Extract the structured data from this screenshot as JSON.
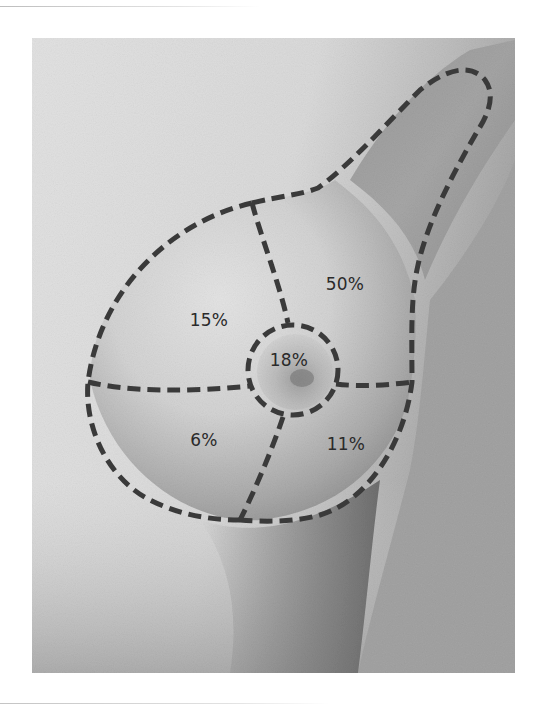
{
  "figure": {
    "colors": {
      "background": "#ffffff",
      "skin_light": "#e6e6e6",
      "skin_mid": "#b4b4b4",
      "skin_dark": "#6e6e6e",
      "backdrop_right": "#9e9e9e",
      "dash_line": "#3a3a3a",
      "label_text": "#2a2a2a"
    },
    "regions": [
      {
        "id": "upper-outer",
        "label": "50%"
      },
      {
        "id": "upper-inner",
        "label": "15%"
      },
      {
        "id": "central-areola",
        "label": "18%"
      },
      {
        "id": "lower-inner",
        "label": "6%"
      },
      {
        "id": "lower-outer",
        "label": "11%"
      }
    ]
  }
}
